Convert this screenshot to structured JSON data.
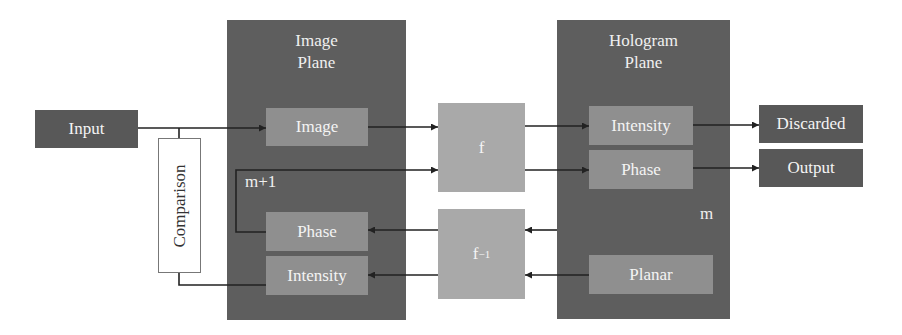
{
  "diagram": {
    "image_plane": {
      "title": "Image\nPlane",
      "boxes": {
        "image": "Image",
        "phase": "Phase",
        "intensity": "Intensity"
      },
      "iteration_label": "m+1"
    },
    "hologram_plane": {
      "title": "Hologram\nPlane",
      "boxes": {
        "intensity": "Intensity",
        "phase": "Phase",
        "planar": "Planar"
      },
      "iteration_label": "m"
    },
    "input": "Input",
    "comparison": "Comparison",
    "forward_transform": "f",
    "inverse_transform": {
      "base": "f",
      "exponent": "−1"
    },
    "outputs": {
      "discarded": "Discarded",
      "output": "Output"
    },
    "colors": {
      "plane_bg": "#5e5e5e",
      "inner_box": "#8f8f8f",
      "transform_box": "#a9a9a9",
      "io_box": "#585858",
      "arrow": "#222222"
    }
  }
}
